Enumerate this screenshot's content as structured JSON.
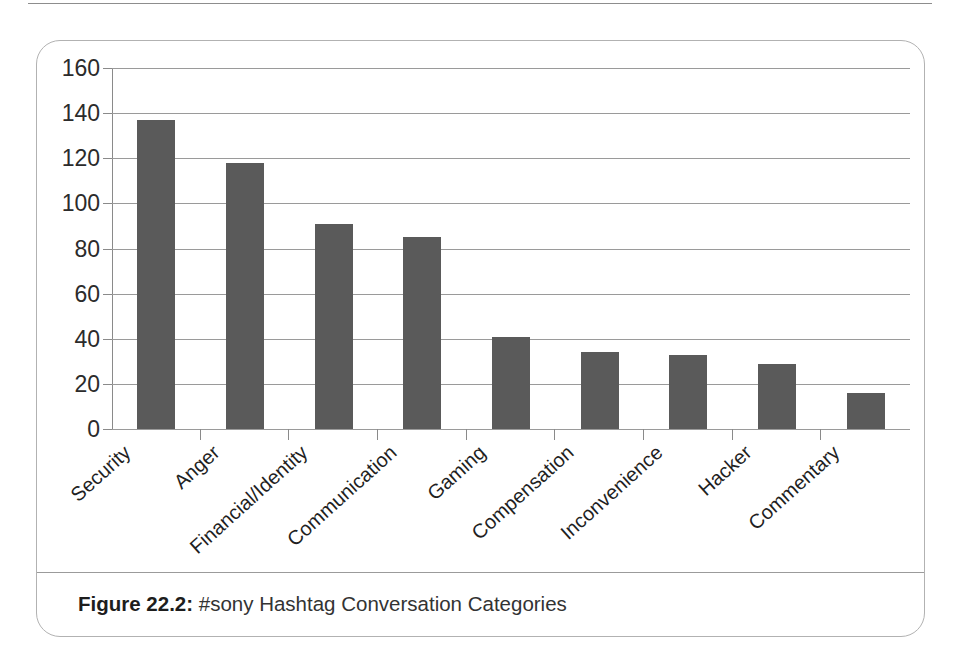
{
  "document": {
    "caption_label": "Figure 22.2:",
    "caption_text": " #sony Hashtag Conversation Categories"
  },
  "colors": {
    "bar_fill": "#5a5a5a",
    "gridline": "#9a9a9a",
    "axis": "#8a8a8a",
    "frame": "#b2b2b2",
    "text": "#1f1f1f"
  },
  "chart_data": {
    "type": "bar",
    "title": "#sony Hashtag Conversation Categories",
    "xlabel": "",
    "ylabel": "",
    "ylim": [
      0,
      160
    ],
    "yticks": [
      0,
      20,
      40,
      60,
      80,
      100,
      120,
      140,
      160
    ],
    "grid": true,
    "legend": null,
    "categories": [
      "Security",
      "Anger",
      "Financial/Identity",
      "Communication",
      "Gaming",
      "Compensation",
      "Inconvenience",
      "Hacker",
      "Commentary"
    ],
    "values": [
      137,
      118,
      91,
      85,
      41,
      34,
      33,
      29,
      16
    ]
  }
}
